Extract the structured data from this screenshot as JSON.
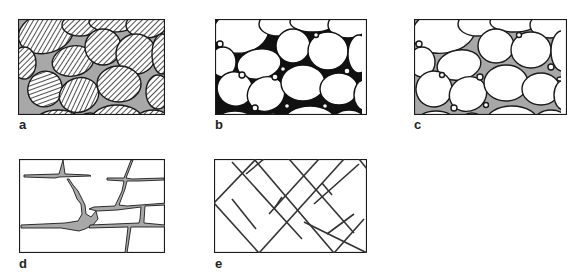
{
  "figure": {
    "panels": [
      {
        "id": "a",
        "label": "a",
        "description": "grains with hatched fill, grey matrix between grains"
      },
      {
        "id": "b",
        "label": "b",
        "description": "white grains with black interstitial cement"
      },
      {
        "id": "c",
        "label": "c",
        "description": "white grains with grey pore-filling and white pores"
      },
      {
        "id": "d",
        "label": "d",
        "description": "blocky fractured rock with grey-filled fractures"
      },
      {
        "id": "e",
        "label": "e",
        "description": "rock with two intersecting diagonal fracture sets"
      }
    ],
    "colors": {
      "outline": "#1a1a1a",
      "grey_fill": "#a8a8a8",
      "background": "#ffffff"
    }
  }
}
